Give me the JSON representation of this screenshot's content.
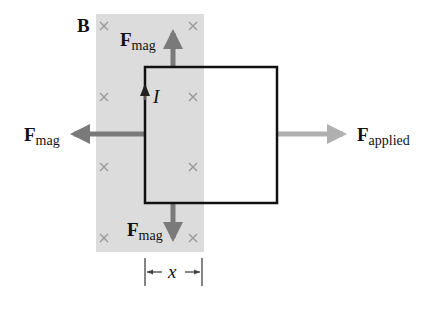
{
  "diagram": {
    "field_label": "B",
    "field_symbol": "×",
    "field_region_color": "#dcdcdc",
    "cross_color": "#9a9a9a",
    "loop_color": "#111111",
    "mag_arrow_color": "#7a7a7a",
    "applied_arrow_color": "#b0b0b0",
    "current_label": "I",
    "forces": {
      "top": {
        "main": "F",
        "sub": "mag"
      },
      "left": {
        "main": "F",
        "sub": "mag"
      },
      "bottom": {
        "main": "F",
        "sub": "mag"
      },
      "applied": {
        "main": "F",
        "sub": "applied"
      }
    },
    "dimension_label": "x"
  }
}
